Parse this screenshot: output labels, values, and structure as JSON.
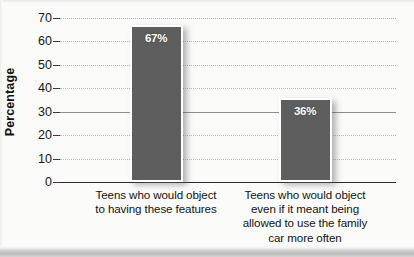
{
  "chart_data": {
    "type": "bar",
    "title": "",
    "xlabel": "",
    "ylabel": "Percentage",
    "ylim": [
      0,
      70
    ],
    "ytick_step": 10,
    "grid": true,
    "legend": "none",
    "categories": [
      "Teens who would object to having these features",
      "Teens who would object even if it meant being allowed to use the family car more often"
    ],
    "category_lines": [
      [
        "Teens who would object",
        "to having these features"
      ],
      [
        "Teens who would object",
        "even if it meant being",
        "allowed to use the family",
        "car more often"
      ]
    ],
    "values": [
      67,
      36
    ],
    "value_labels": [
      "67%",
      "36%"
    ],
    "yticks": [
      "70",
      "60",
      "50",
      "40",
      "30",
      "20",
      "10",
      "0"
    ],
    "ytick_values": [
      70,
      60,
      50,
      40,
      30,
      20,
      10,
      0
    ],
    "colors": {
      "bar_fill": "#5e5e5e",
      "bar_border": "#ffffff",
      "background": "#fbfbfa",
      "gridline": "#b9b9b9",
      "axis": "#2b2b2b",
      "text": "#131313",
      "value_text": "#ffffff"
    }
  }
}
